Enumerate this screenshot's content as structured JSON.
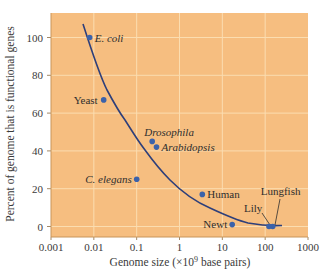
{
  "chart_data": {
    "type": "scatter",
    "title": "",
    "xlabel": "Genome size (×10⁹ base pairs)",
    "xlabel_parts": {
      "pre": "Genome size (",
      "times": "×",
      "base": "10",
      "exp": "9",
      "post": " base pairs)"
    },
    "ylabel": "Percent of genome that is functional genes",
    "xscale": "log",
    "xlim": [
      0.001,
      1000
    ],
    "ylim": [
      -5,
      110
    ],
    "x_ticks": [
      "0.001",
      "0.01",
      "0.1",
      "1",
      "10",
      "100",
      "1000"
    ],
    "y_ticks": [
      "0",
      "20",
      "40",
      "60",
      "80",
      "100"
    ],
    "grid": true,
    "legend": null,
    "points": [
      {
        "label": "E. coli",
        "x": 0.008,
        "y": 100,
        "italic": true
      },
      {
        "label": "Yeast",
        "x": 0.017,
        "y": 67,
        "italic": false
      },
      {
        "label": "Drosophila",
        "x": 0.23,
        "y": 45,
        "italic": true
      },
      {
        "label": "Arabidopsis",
        "x": 0.29,
        "y": 42,
        "italic": true
      },
      {
        "label": "C. elegans",
        "x": 0.1,
        "y": 25,
        "italic": true
      },
      {
        "label": "Human",
        "x": 3.4,
        "y": 17,
        "italic": false
      },
      {
        "label": "Newt",
        "x": 17,
        "y": 1,
        "italic": false
      },
      {
        "label": "Lily",
        "x": 123,
        "y": 0,
        "italic": false
      },
      {
        "label": "Lungfish",
        "x": 150,
        "y": 0,
        "italic": false
      }
    ],
    "trend_curve": {
      "description": "Decreasing fitted curve from ~110% at 0.006 to ~0% at ~200",
      "approx_points": [
        [
          0.0065,
          108
        ],
        [
          0.024,
          72
        ],
        [
          0.063,
          56
        ],
        [
          0.18,
          40
        ],
        [
          0.7,
          24
        ],
        [
          6,
          9
        ],
        [
          40,
          2
        ],
        [
          250,
          0
        ]
      ]
    },
    "colors": {
      "plot_background": "#F6BE80",
      "gridline": "#FBDDB0",
      "point": "#3B62AA",
      "curve": "#2E3F7A",
      "text": "#3a3a3a"
    }
  }
}
